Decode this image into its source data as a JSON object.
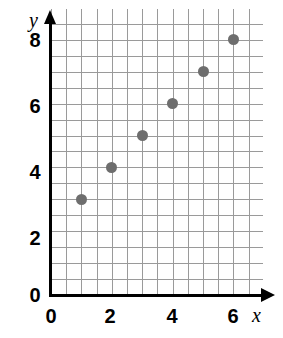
{
  "chart_data": {
    "type": "scatter",
    "title": "",
    "xlabel": "x",
    "ylabel": "y",
    "x": [
      1,
      2,
      3,
      4,
      5,
      6
    ],
    "values": [
      3,
      4,
      5,
      6,
      7,
      8
    ],
    "points": [
      {
        "x": 1,
        "y": 3
      },
      {
        "x": 2,
        "y": 4
      },
      {
        "x": 3,
        "y": 5
      },
      {
        "x": 4,
        "y": 6
      },
      {
        "x": 5,
        "y": 7
      },
      {
        "x": 6,
        "y": 8
      }
    ],
    "xlim": [
      0,
      7
    ],
    "ylim": [
      0,
      8.7
    ],
    "xticks": [
      0,
      2,
      4,
      6
    ],
    "xtick_labels": [
      "0",
      "2",
      "4",
      "6"
    ],
    "yticks": [
      0,
      2,
      4,
      6,
      8
    ],
    "ytick_labels": [
      "0",
      "2",
      "4",
      "6",
      "8"
    ],
    "grid": true,
    "grid_step": 0.5,
    "grid_color": "#9a9a9a",
    "marker_color": "#6e6e6e",
    "axis_color": "#000000",
    "legend": null
  },
  "axes": {
    "x_name": "x",
    "y_name": "y"
  },
  "xtick_labels": [
    "0",
    "2",
    "4",
    "6"
  ],
  "ytick_labels": [
    "8",
    "6",
    "4",
    "2",
    "0"
  ]
}
